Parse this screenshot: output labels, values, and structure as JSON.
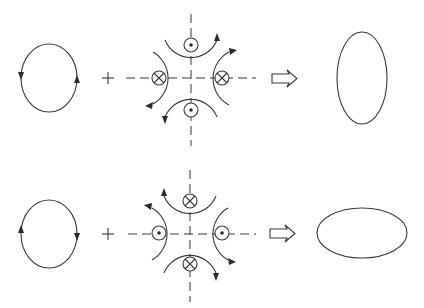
{
  "diagram": {
    "colors": {
      "line": "#3a3a3a",
      "background": "#ffffff"
    },
    "rows": [
      {
        "id": "row-1",
        "beam_in": {
          "shape": "circle",
          "direction_left": "down",
          "direction_right": "up"
        },
        "operator": "+",
        "quadrupole": {
          "top": "dot",
          "bottom": "dot",
          "left": "cross",
          "right": "cross",
          "dot_meaning": "current out of page (⊙)",
          "cross_meaning": "current into page (⊗)"
        },
        "result_arrow": "⇒",
        "beam_out": {
          "shape": "ellipse",
          "orientation": "vertical"
        }
      },
      {
        "id": "row-2",
        "beam_in": {
          "shape": "circle",
          "direction_left": "up",
          "direction_right": "down"
        },
        "operator": "+",
        "quadrupole": {
          "top": "cross",
          "bottom": "cross",
          "left": "dot",
          "right": "dot",
          "dot_meaning": "current out of page (⊙)",
          "cross_meaning": "current into page (⊗)"
        },
        "result_arrow": "⇒",
        "beam_out": {
          "shape": "ellipse",
          "orientation": "horizontal"
        }
      }
    ]
  }
}
